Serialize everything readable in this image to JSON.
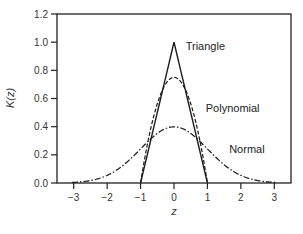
{
  "chart_data": {
    "type": "line",
    "title": "",
    "xlabel": "z",
    "ylabel": "K(z)",
    "xlim": [
      -3.5,
      3.5
    ],
    "ylim": [
      0.0,
      1.2
    ],
    "grid": false,
    "legend": "inline labels",
    "x_ticks": [
      -3,
      -2,
      -1,
      0,
      1,
      2,
      3
    ],
    "x_tick_labels": [
      "−3",
      "−2",
      "−1",
      "0",
      "1",
      "2",
      "3"
    ],
    "y_ticks": [
      0.0,
      0.2,
      0.4,
      0.6,
      0.8,
      1.0,
      1.2
    ],
    "y_tick_labels": [
      "0.0",
      "0.2",
      "0.4",
      "0.6",
      "0.8",
      "1.0",
      "1.2"
    ],
    "series": [
      {
        "name": "Triangle",
        "style": "solid",
        "formula": "1 - |z| for |z| <= 1, else 0",
        "x": [
          -1,
          0,
          1
        ],
        "values": [
          0.0,
          1.0,
          0.0
        ],
        "label_pos": [
          0.35,
          0.97
        ]
      },
      {
        "name": "Polynomial",
        "style": "dashed",
        "formula": "0.75 * (1 - z^2) for |z| <= 1, else 0",
        "x": [
          -1,
          -0.75,
          -0.5,
          -0.25,
          0,
          0.25,
          0.5,
          0.75,
          1
        ],
        "values": [
          0.0,
          0.328,
          0.5625,
          0.703,
          0.75,
          0.703,
          0.5625,
          0.328,
          0.0
        ],
        "label_pos": [
          0.95,
          0.53
        ]
      },
      {
        "name": "Normal",
        "style": "dash-dot",
        "formula": "exp(-z^2/2) / sqrt(2*pi)",
        "x": [
          -3,
          -2,
          -1,
          0,
          1,
          2,
          3
        ],
        "values": [
          0.004,
          0.054,
          0.242,
          0.399,
          0.242,
          0.054,
          0.004
        ],
        "label_pos": [
          1.65,
          0.24
        ]
      }
    ]
  }
}
